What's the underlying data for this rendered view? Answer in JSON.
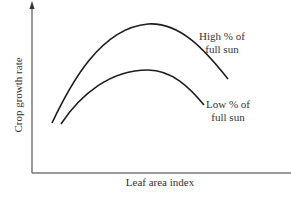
{
  "diagram": {
    "x_axis_label": "Leaf area index",
    "y_axis_label": "Crop growth rate",
    "curves": [
      {
        "name": "high",
        "label_line1": "High % of",
        "label_line2": "full sun",
        "path": "M52,123 C70,85 100,28 148,24 C180,22 205,50 228,79"
      },
      {
        "name": "low",
        "label_line1": "Low % of",
        "label_line2": "full sun",
        "path": "M61,124 C80,95 110,70 148,70 C172,70 190,88 204,105"
      }
    ],
    "colors": {
      "curve": "#1e1e1e",
      "axis": "#555555",
      "text": "#333333",
      "background": "#ffffff"
    }
  },
  "chart_data": {
    "type": "line",
    "title": "",
    "xlabel": "Leaf area index",
    "ylabel": "Crop growth rate",
    "grid": false,
    "legend": "inline annotations",
    "series": [
      {
        "name": "High % of full sun",
        "shape": "rise to maximum then decline",
        "relative_peak": "higher"
      },
      {
        "name": "Low % of full sun",
        "shape": "rise to maximum then decline",
        "relative_peak": "lower"
      }
    ]
  }
}
